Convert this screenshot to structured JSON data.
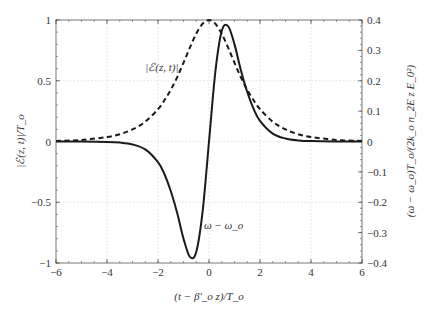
{
  "chart_data": {
    "type": "line",
    "title": "",
    "xlabel": "(t − β′_o z)/T_o",
    "ylabel_left": "|ℰ(z, t)|/T_o",
    "ylabel_right": "(ω − ω_o)T_o/(2k_o n_2E z E_0²)",
    "xlim": [
      -6,
      6
    ],
    "ylim_left": [
      -1,
      1
    ],
    "ylim_right": [
      -0.4,
      0.4
    ],
    "xticks": [
      -6,
      -4,
      -2,
      0,
      2,
      4,
      6
    ],
    "xtick_labels": [
      "−6",
      "−4",
      "−2",
      "0",
      "2",
      "4",
      "6"
    ],
    "yticks_left": [
      -1,
      -0.5,
      0,
      0.5,
      1
    ],
    "ytick_labels_left": [
      "−1",
      "−0.5",
      "0",
      "0.5",
      "1"
    ],
    "yticks_right": [
      -0.4,
      -0.3,
      -0.2,
      -0.1,
      0,
      0.1,
      0.2,
      0.3,
      0.4
    ],
    "ytick_labels_right": [
      "−0.4",
      "−0.3",
      "−0.2",
      "−0.1",
      "0",
      "0.1",
      "0.2",
      "0.3",
      "0.4"
    ],
    "grid": true,
    "legend": "none",
    "annotations": [
      {
        "text": "|ℰ(z, t)|",
        "x": -2.5,
        "y": 0.58
      },
      {
        "text": "ω − ω_o",
        "x": -0.2,
        "y": -0.72
      }
    ],
    "x": [
      -6,
      -5,
      -4,
      -3.5,
      -3,
      -2.5,
      -2,
      -1.75,
      -1.5,
      -1.25,
      -1,
      -0.75,
      -0.5,
      -0.25,
      0,
      0.25,
      0.5,
      0.75,
      1,
      1.25,
      1.5,
      1.75,
      2,
      2.5,
      3,
      3.5,
      4,
      5,
      6
    ],
    "series": [
      {
        "name": "|ℰ(z, t)|",
        "style": "dashed",
        "axis": "left",
        "values": [
          0.005,
          0.013,
          0.037,
          0.06,
          0.099,
          0.163,
          0.266,
          0.34,
          0.425,
          0.528,
          0.648,
          0.772,
          0.887,
          0.969,
          1.0,
          0.969,
          0.887,
          0.772,
          0.648,
          0.528,
          0.425,
          0.34,
          0.266,
          0.163,
          0.099,
          0.06,
          0.037,
          0.013,
          0.005
        ]
      },
      {
        "name": "ω − ω_o",
        "style": "solid",
        "axis": "right",
        "values": [
          0.0,
          -0.0002,
          -0.0013,
          -0.0036,
          -0.0098,
          -0.0261,
          -0.0681,
          -0.1071,
          -0.163,
          -0.2348,
          -0.3197,
          -0.3798,
          -0.3637,
          -0.2304,
          0.0,
          0.2304,
          0.3637,
          0.3798,
          0.3197,
          0.2348,
          0.163,
          0.1071,
          0.0681,
          0.0261,
          0.0098,
          0.0036,
          0.0013,
          0.0002,
          0.0
        ]
      }
    ]
  },
  "colors": {
    "curve": "#1a1a1a",
    "frame": "#555555",
    "grid": "#d9d9d9",
    "text": "#333333"
  }
}
